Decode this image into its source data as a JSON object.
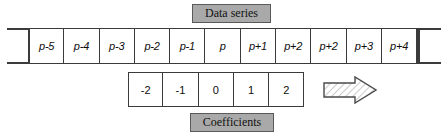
{
  "figure": {
    "colors": {
      "banner_fill": "#a9a9a9",
      "banner_border": "#5a5a5a",
      "line": "#3b3b3b",
      "cell_fill": "#ffffff",
      "text": "#0d0d0d"
    }
  },
  "banners": {
    "data_series": "Data series",
    "coefficients": "Coefficients"
  },
  "series_row": {
    "name": "data-series",
    "cells": [
      {
        "label": "p-5"
      },
      {
        "label": "p-4"
      },
      {
        "label": "p-3"
      },
      {
        "label": "p-2"
      },
      {
        "label": "p-1"
      },
      {
        "label": "p"
      },
      {
        "label": "p+1"
      },
      {
        "label": "p+2"
      },
      {
        "label": "p+2"
      },
      {
        "label": "p+3"
      },
      {
        "label": "p+4"
      }
    ]
  },
  "coefficients_row": {
    "name": "coefficients",
    "cells": [
      {
        "label": "-2"
      },
      {
        "label": "-1"
      },
      {
        "label": "0"
      },
      {
        "label": "1"
      },
      {
        "label": "2"
      }
    ]
  },
  "arrow": {
    "name": "right-arrow",
    "direction": "right",
    "fill": "hatched"
  }
}
